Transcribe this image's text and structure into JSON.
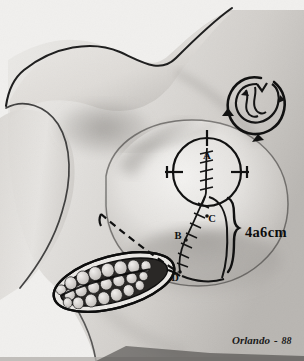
{
  "figure": {
    "medium": "pencil-and-charcoal anatomical drawing",
    "background_color": "#f2f2f0",
    "ink_color": "#141414",
    "width": 304,
    "height": 361
  },
  "annotations": {
    "point_a": "A",
    "point_b": "B",
    "point_c": "C",
    "point_d": "D",
    "measurement": "4a6cm"
  },
  "signature": {
    "artist": "Orlando",
    "separator": "-",
    "year": "88"
  },
  "regions": {
    "torso": "patient-torso",
    "shoulder": "shoulder-contour",
    "breast": "breast-mound",
    "areola": "areola-circle",
    "suture_line": "vertical-suture-line",
    "oblique_suture": "oblique-suture-line",
    "inframammary_bracket": "measurement-bracket",
    "dashed_marking": "dashed-resection-marking",
    "specimen": "excised-glandular-specimen",
    "inset": "rotation-flap-inset"
  }
}
